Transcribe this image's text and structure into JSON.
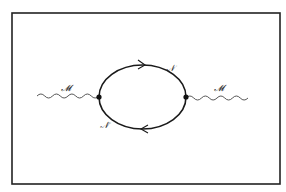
{
  "diagram": {
    "type": "feynman-diagram",
    "frame": {
      "x": 12,
      "y": 13,
      "width": 268,
      "height": 171,
      "stroke": "#222222"
    },
    "loop": {
      "cx": 142.5,
      "cy": 97,
      "rx": 43.5,
      "ry": 32,
      "stroke": "#1a1a1a"
    },
    "vertices": [
      {
        "id": "left-vertex",
        "x": 99,
        "y": 97
      },
      {
        "id": "right-vertex",
        "x": 186,
        "y": 97
      }
    ],
    "external_lines": [
      {
        "id": "left-wavy",
        "label": "𝓜",
        "from_x": 37,
        "to_x": 99,
        "y": 97
      },
      {
        "id": "right-wavy",
        "label": "𝓜",
        "from_x": 186,
        "to_x": 248,
        "y": 97
      }
    ],
    "internal_lines": [
      {
        "id": "upper-arc",
        "label": "𝒩",
        "arrow_direction": "right"
      },
      {
        "id": "lower-arc",
        "label": "𝒩̄",
        "arrow_direction": "left"
      }
    ],
    "labels": {
      "left_external": "𝓜",
      "right_external": "𝓜",
      "upper_internal": "𝒩",
      "lower_internal": "𝒩̄"
    }
  }
}
